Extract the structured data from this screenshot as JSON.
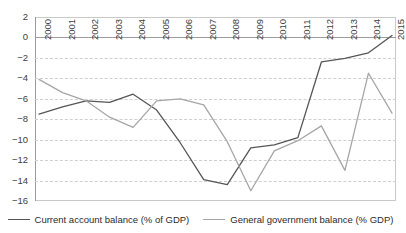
{
  "chart_data": {
    "type": "line",
    "title": "",
    "subtitle": "",
    "xlabel": "",
    "ylabel": "",
    "grid": true,
    "legend_position": "bottom",
    "ylim": [
      -16,
      2
    ],
    "ytick_step": 2,
    "yticks": [
      "2",
      "0",
      "−2",
      "−4",
      "−6",
      "−8",
      "−10",
      "−12",
      "−14",
      "−16"
    ],
    "ytick_values": [
      2,
      0,
      -2,
      -4,
      -6,
      -8,
      -10,
      -12,
      -14,
      -16
    ],
    "categories": [
      "2000",
      "2001",
      "2002",
      "2003",
      "2004",
      "2005",
      "2006",
      "2007",
      "2008",
      "2009",
      "2010",
      "2011",
      "2012",
      "2013",
      "2014",
      "2015"
    ],
    "series": [
      {
        "name": "Current account balance (% of GDP)",
        "color": "#555555",
        "values": [
          -7.5,
          -6.8,
          -6.2,
          -6.35,
          -5.55,
          -7.1,
          -10.3,
          -13.9,
          -14.4,
          -10.8,
          -10.5,
          -9.8,
          -2.4,
          -2.05,
          -1.5,
          0.2
        ]
      },
      {
        "name": "General government balance (% GDP)",
        "color": "#a6a6a6",
        "values": [
          -4.1,
          -5.4,
          -6.2,
          -7.8,
          -8.8,
          -6.2,
          -6.0,
          -6.6,
          -10.2,
          -15.0,
          -11.1,
          -10.1,
          -8.65,
          -13.0,
          -3.5,
          -7.4
        ]
      }
    ]
  },
  "legend": {
    "entries": [
      {
        "label": "Current account balance (% of GDP)",
        "swatch": "dark"
      },
      {
        "label": "General government balance (% GDP)",
        "swatch": "light"
      }
    ]
  },
  "colors": {
    "series_dark": "#555555",
    "series_light": "#a6a6a6",
    "grid": "#cfcfcf",
    "axis": "#9a9a9a",
    "text": "#404040",
    "background": "#ffffff"
  }
}
